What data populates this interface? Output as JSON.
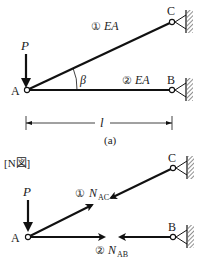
{
  "figure_a": {
    "load": "P",
    "node_a": "A",
    "node_b": "B",
    "node_c": "C",
    "member1": "①",
    "member1_prop": "EA",
    "member2": "②",
    "member2_prop": "EA",
    "angle": "β",
    "length": "l",
    "caption": "(a)"
  },
  "figure_n": {
    "title": "[N図]",
    "load": "P",
    "node_a": "A",
    "node_b": "B",
    "node_c": "C",
    "force1_num": "①",
    "force1_label": "N",
    "force1_sub": "AC",
    "force2_num": "②",
    "force2_label": "N",
    "force2_sub": "AB"
  }
}
